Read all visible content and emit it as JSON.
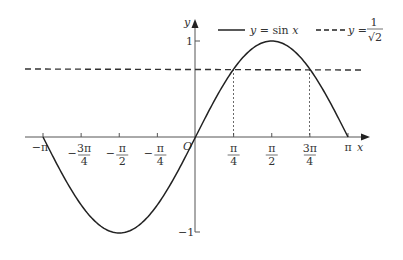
{
  "chart_data": {
    "type": "line",
    "title": "",
    "xlabel": "x",
    "ylabel": "y",
    "origin_label": "O",
    "xlim": [
      -3.14159,
      3.14159
    ],
    "ylim": [
      -1,
      1
    ],
    "grid": false,
    "legend_position": "top-right",
    "x_ticks": [
      {
        "value": -3.14159,
        "label": "−π"
      },
      {
        "value": -2.35619,
        "label": "−3π/4",
        "num": "3π",
        "den": "4",
        "sign": "−"
      },
      {
        "value": -1.5708,
        "label": "−π/2",
        "num": "π",
        "den": "2",
        "sign": "−"
      },
      {
        "value": -0.7854,
        "label": "−π/4",
        "num": "π",
        "den": "4",
        "sign": "−"
      },
      {
        "value": 0.7854,
        "label": "π/4",
        "num": "π",
        "den": "4",
        "sign": ""
      },
      {
        "value": 1.5708,
        "label": "π/2",
        "num": "π",
        "den": "2",
        "sign": ""
      },
      {
        "value": 2.35619,
        "label": "3π/4",
        "num": "3π",
        "den": "4",
        "sign": ""
      },
      {
        "value": 3.14159,
        "label": "π"
      }
    ],
    "y_ticks": [
      {
        "value": 1,
        "label": "1"
      },
      {
        "value": -1,
        "label": "−1"
      }
    ],
    "series": [
      {
        "name": "y = sin x",
        "style": "solid",
        "function": "sin(x)",
        "domain": [
          -3.14159,
          3.14159
        ]
      },
      {
        "name": "y = 1/√2",
        "style": "dashed",
        "value": 0.7071
      }
    ],
    "annotations": [
      {
        "type": "vertical-dotted",
        "x": 0.7854,
        "from_y": 0,
        "to_y": 0.7071,
        "note": "intersection at π/4"
      },
      {
        "type": "vertical-dotted",
        "x": 2.35619,
        "from_y": 0,
        "to_y": 0.7071,
        "note": "intersection at 3π/4"
      }
    ]
  },
  "legend": {
    "sin_label_lhs": "y",
    "sin_label_eq": " = sin ",
    "sin_label_var": "x",
    "const_label_lhs": "y",
    "const_label_eq": " = ",
    "const_num": "1",
    "const_den": "√2"
  },
  "axes": {
    "x_label": "x",
    "y_label": "y",
    "origin": "O",
    "y_tick_1": "1",
    "y_tick_neg1": "−1",
    "x_tick_pi": "π",
    "x_tick_negpi": "−π"
  }
}
